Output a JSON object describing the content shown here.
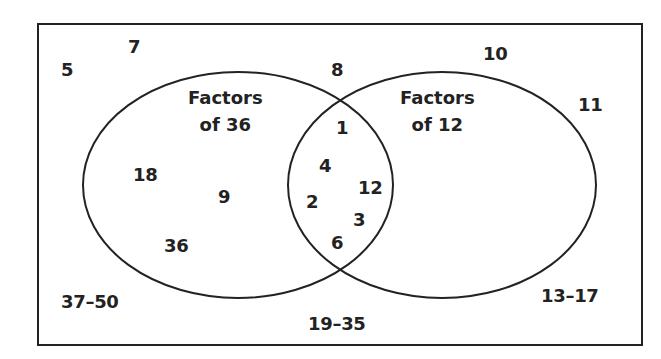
{
  "diagram": {
    "type": "venn",
    "colors": {
      "stroke": "#222222",
      "background": "#ffffff",
      "text": "#222222"
    },
    "sets": [
      {
        "title_line1": "Factors",
        "title_line2": "of 36"
      },
      {
        "title_line1": "Factors",
        "title_line2": "of 12"
      }
    ],
    "only_36": [
      "18",
      "9",
      "36"
    ],
    "both": [
      "1",
      "4",
      "2",
      "12",
      "3",
      "6"
    ],
    "only_12": [],
    "outside": [
      "5",
      "7",
      "8",
      "10",
      "11",
      "37–50",
      "19–35",
      "13–17"
    ]
  }
}
